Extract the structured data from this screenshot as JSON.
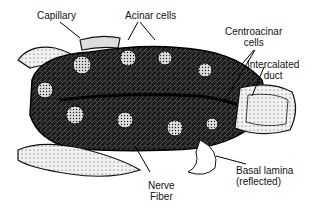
{
  "figure": {
    "labels": {
      "capillary": "Capillary",
      "acinar_cells": "Acinar cells",
      "centroacinar_1": "Centroacinar",
      "centroacinar_2": "cells",
      "intercalated_1": "Intercalated",
      "intercalated_2": "duct",
      "basal_1": "Basal lamina",
      "basal_2": "(reflected)",
      "nerve_1": "Nerve",
      "nerve_2": "Fiber"
    }
  }
}
